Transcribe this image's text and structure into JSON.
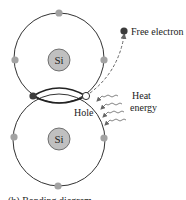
{
  "diagram": {
    "atoms": [
      {
        "label": "Si",
        "cx": 59,
        "cy": 60
      },
      {
        "label": "Si",
        "cx": 59,
        "cy": 141
      }
    ],
    "labels": {
      "free_electron": "Free electron",
      "hole": "Hole",
      "heat_line1": "Heat",
      "heat_line2": "energy",
      "caption": "(b) Bonding diagram"
    },
    "colors": {
      "orbit": "#333333",
      "electron": "#a3a3a3",
      "bond_electron": "#3c3c3c",
      "nucleus_fill": "#c0c0c0",
      "free_electron": "#3c3c3c",
      "hole_fill": "#ffffff"
    }
  }
}
